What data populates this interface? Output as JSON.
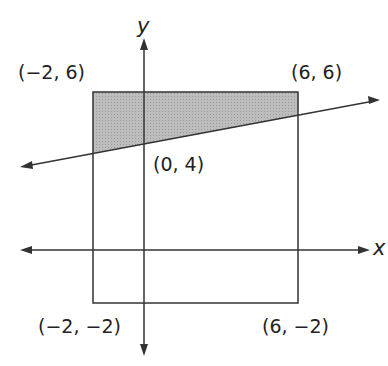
{
  "diagram": {
    "axes": {
      "x_label": "x",
      "y_label": "y"
    },
    "points": {
      "top_left": "(−2, 6)",
      "top_right": "(6, 6)",
      "bottom_left": "(−2, −2)",
      "bottom_right": "(6, −2)",
      "y_intercept": "(0, 4)"
    },
    "colors": {
      "shade": "#b3b3b3",
      "stroke": "#333333"
    }
  }
}
